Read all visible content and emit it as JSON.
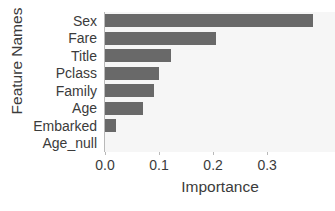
{
  "chart_data": {
    "type": "bar",
    "orientation": "horizontal",
    "title": "",
    "xlabel": "Importance",
    "ylabel": "Feature Names",
    "categories": [
      "Sex",
      "Fare",
      "Title",
      "Pclass",
      "Family",
      "Age",
      "Embarked",
      "Age_null"
    ],
    "values": [
      0.385,
      0.205,
      0.122,
      0.1,
      0.09,
      0.07,
      0.02,
      0.0
    ],
    "xlim": [
      0.0,
      0.4255
    ],
    "xticks": [
      0.0,
      0.1,
      0.2,
      0.3
    ],
    "xticklabels": [
      "0.0",
      "0.1",
      "0.2",
      "0.3"
    ],
    "grid": false,
    "legend": null,
    "bar_color": "#696969",
    "plot_background": "#f6f6f6",
    "figure_background": "#ffffff",
    "text_color": "#3b3b3b"
  }
}
